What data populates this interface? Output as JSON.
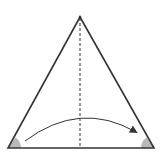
{
  "diagram": {
    "type": "isosceles-triangle-fold",
    "colors": {
      "stroke": "#333333",
      "angle_fill": "#b8b8b8",
      "background": "#ffffff"
    },
    "apex": [
      80,
      17
    ],
    "base_left": [
      8,
      148
    ],
    "base_right": [
      154,
      148
    ],
    "axis_of_symmetry": "dashed",
    "arrow": {
      "from": [
        25,
        141
      ],
      "to": [
        136,
        132
      ],
      "direction": "left-to-right"
    },
    "marked_angles": [
      "base-left",
      "base-right"
    ]
  }
}
